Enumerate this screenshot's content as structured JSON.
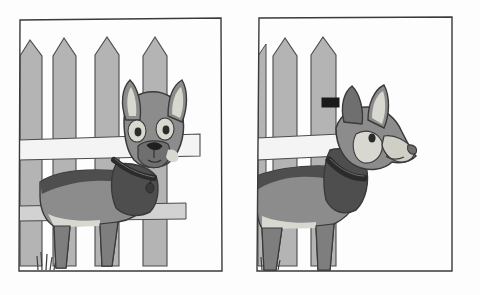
{
  "illustration": {
    "title": "Two-panel illustration of a dog behind a picket fence",
    "caption_left": "Dog facing forward at fence",
    "caption_right": "Dog in profile facing right at fence",
    "background_color": "#fdfdfd",
    "ink_color": "#3a3a3a"
  },
  "palette": {
    "paper": "#fdfdfd",
    "outline": "#3a3a3a",
    "fence_fill": "#b4b4b4",
    "fence_rail": "#f2f2f2",
    "fence_shadow": "#9a9a9a",
    "dog_body": "#8c8c8c",
    "dog_dark": "#4e4e4e",
    "dog_light": "#d8d8d0",
    "dog_muzzle": "#cfcfc6",
    "collar": "#2b2b2b",
    "placard": "#1a1a1a",
    "grass": "#4e4e4e"
  },
  "panels": [
    {
      "id": "panel-left",
      "name": "left-panel",
      "frame": {
        "x": 18,
        "y": 18,
        "width": 204,
        "height": 254
      },
      "fence": {
        "picket_count": 4,
        "picket_label": "picket",
        "rail_count": 2,
        "placard_label": "fence-placard",
        "placard": {
          "x": 152,
          "y": 98,
          "width": 16,
          "height": 9
        }
      },
      "dog": {
        "view": "front",
        "label": "dog-front-view",
        "has_collar": true,
        "has_tag": true,
        "ear_count": 2,
        "eye_count": 2,
        "leg_count": 4
      },
      "grass": {
        "tuft_count": 1,
        "x": 38,
        "y": 268
      }
    },
    {
      "id": "panel-right",
      "name": "right-panel",
      "frame": {
        "x": 257,
        "y": 16,
        "width": 196,
        "height": 256
      },
      "fence": {
        "picket_count": 2,
        "picket_label": "picket",
        "rail_count": 2,
        "placard_label": "fence-placard",
        "placard": {
          "x": 322,
          "y": 98,
          "width": 17,
          "height": 9
        }
      },
      "dog": {
        "view": "profile-right",
        "label": "dog-profile-view",
        "has_collar": true,
        "has_tag": false,
        "ear_count": 2,
        "eye_count": 1,
        "leg_count": 4
      },
      "grass": {
        "tuft_count": 1,
        "x": 264,
        "y": 268
      }
    }
  ]
}
